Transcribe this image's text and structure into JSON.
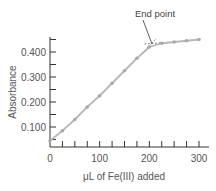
{
  "chart_data": {
    "type": "line",
    "title": "",
    "xlabel": "μL of Fe(III) added",
    "ylabel": "Absorbance",
    "xlim": [
      0,
      300
    ],
    "ylim": [
      0,
      0.46
    ],
    "x_ticks_labeled": [
      "0",
      "100",
      "200",
      "300"
    ],
    "y_ticks_labeled": [
      "0.100",
      "0.200",
      "0.300",
      "0.400"
    ],
    "x_minor_tick_step": 25,
    "y_minor_tick_step": 0.05,
    "grid": false,
    "legend": null,
    "series": [
      {
        "name": "Titration",
        "x": [
          0,
          25,
          50,
          75,
          100,
          125,
          150,
          175,
          200,
          225,
          250,
          275,
          300
        ],
        "values": [
          0.045,
          0.085,
          0.13,
          0.18,
          0.225,
          0.275,
          0.325,
          0.375,
          0.42,
          0.435,
          0.44,
          0.445,
          0.45
        ]
      }
    ],
    "annotations": [
      {
        "text": "End point",
        "x": 205,
        "y": 0.43
      }
    ],
    "colors": {
      "line": "#b8b8b8",
      "marker": "#a8a8a8",
      "axis": "#333333",
      "text": "#555555",
      "extrapolation": "#666666"
    }
  }
}
